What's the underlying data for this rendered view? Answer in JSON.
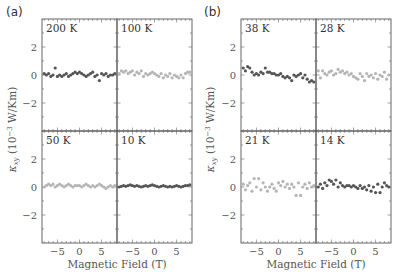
{
  "figure": {
    "panels": [
      {
        "letter": "(a)",
        "xlabel": "Magnetic Field (T)",
        "ylabel": "κ_xy (10^-3 W/Km)"
      },
      {
        "letter": "(b)",
        "xlabel": "Magnetic Field (T)",
        "ylabel": "κ_xy (10^-3 W/Km)"
      }
    ],
    "x_tick_labels": [
      "−5",
      "0",
      "5"
    ],
    "y_tick_labels": [
      "2",
      "0",
      "−2"
    ],
    "colors": {
      "dark": "#555555",
      "light": "#b5b5b5",
      "frame": "#555555"
    }
  },
  "chart_data": [
    {
      "type": "scatter",
      "title": "(a)",
      "xlabel": "Magnetic Field (T)",
      "ylabel": "κxy (10⁻³ W/Km)",
      "xlim": [
        -8.5,
        8.5
      ],
      "ylim": [
        -4,
        4
      ],
      "xticks": [
        -5,
        0,
        5
      ],
      "yticks": [
        -2,
        0,
        2
      ],
      "grid": false,
      "layout": "2x2 subplots sharing axes",
      "series": [
        {
          "name": "200 K",
          "subplot": "top-left",
          "color": "#555555",
          "x": [
            -8,
            -7.5,
            -7,
            -6.5,
            -6,
            -5.5,
            -5,
            -4.5,
            -4,
            -3.5,
            -3,
            -2.5,
            -2,
            -1.5,
            -1,
            -0.5,
            0,
            0.5,
            1,
            1.5,
            2,
            2.5,
            3,
            3.5,
            4,
            4.5,
            5,
            5.5,
            6,
            6.5,
            7,
            7.5,
            8
          ],
          "y": [
            0.1,
            0.0,
            0.1,
            -0.1,
            0.0,
            0.5,
            -0.1,
            0.0,
            -0.1,
            0.0,
            0.1,
            -0.1,
            0.0,
            0.1,
            0.2,
            0.1,
            0.2,
            0.1,
            0.0,
            -0.1,
            0.0,
            0.1,
            0.2,
            -0.1,
            0.0,
            -0.4,
            0.1,
            0.0,
            0.1,
            -0.1,
            0.0,
            0.0,
            0.1
          ]
        },
        {
          "name": "100 K",
          "subplot": "top-right",
          "color": "#b5b5b5",
          "x": [
            -8,
            -7.5,
            -7,
            -6.5,
            -6,
            -5.5,
            -5,
            -4.5,
            -4,
            -3.5,
            -3,
            -2.5,
            -2,
            -1.5,
            -1,
            -0.5,
            0,
            0.5,
            1,
            1.5,
            2,
            2.5,
            3,
            3.5,
            4,
            4.5,
            5,
            5.5,
            6,
            6.5,
            7,
            7.5,
            8
          ],
          "y": [
            0.1,
            0.3,
            0.2,
            0.3,
            0.1,
            0.2,
            0.3,
            0.0,
            0.2,
            0.1,
            0.3,
            -0.1,
            0.1,
            0.0,
            0.1,
            0.2,
            0.1,
            0.0,
            -0.1,
            0.1,
            -0.2,
            0.0,
            -0.1,
            0.1,
            -0.2,
            0.0,
            -0.1,
            -0.2,
            0.0,
            -0.2,
            0.1,
            0.2,
            0.2
          ]
        },
        {
          "name": "50 K",
          "subplot": "bottom-left",
          "color": "#b5b5b5",
          "x": [
            -8,
            -7.5,
            -7,
            -6.5,
            -6,
            -5.5,
            -5,
            -4.5,
            -4,
            -3.5,
            -3,
            -2.5,
            -2,
            -1.5,
            -1,
            -0.5,
            0,
            0.5,
            1,
            1.5,
            2,
            2.5,
            3,
            3.5,
            4,
            4.5,
            5,
            5.5,
            6,
            6.5,
            7,
            7.5,
            8
          ],
          "y": [
            0.0,
            0.1,
            0.2,
            0.1,
            0.2,
            0.0,
            0.1,
            0.2,
            0.1,
            0.0,
            0.1,
            0.2,
            0.1,
            0.0,
            0.1,
            0.1,
            0.1,
            0.0,
            0.1,
            0.2,
            0.1,
            0.0,
            0.1,
            0.0,
            0.1,
            0.2,
            0.1,
            0.0,
            -0.1,
            0.0,
            0.1,
            0.0,
            0.1
          ]
        },
        {
          "name": "10 K",
          "subplot": "bottom-right",
          "color": "#555555",
          "x": [
            -8,
            -7.5,
            -7,
            -6.5,
            -6,
            -5.5,
            -5,
            -4.5,
            -4,
            -3.5,
            -3,
            -2.5,
            -2,
            -1.5,
            -1,
            -0.5,
            0,
            0.5,
            1,
            1.5,
            2,
            2.5,
            3,
            3.5,
            4,
            4.5,
            5,
            5.5,
            6,
            6.5,
            7,
            7.5,
            8
          ],
          "y": [
            0.0,
            0.05,
            0.1,
            0.05,
            0.1,
            0.15,
            0.1,
            0.05,
            0.1,
            0.05,
            0.0,
            0.05,
            0.1,
            0.05,
            0.1,
            0.15,
            0.1,
            0.05,
            0.0,
            0.05,
            0.1,
            0.05,
            0.0,
            0.05,
            0.0,
            0.05,
            0.1,
            0.05,
            0.0,
            0.05,
            0.1,
            0.1,
            0.15
          ]
        }
      ]
    },
    {
      "type": "scatter",
      "title": "(b)",
      "xlabel": "Magnetic Field (T)",
      "ylabel": "κxy (10⁻³ W/Km)",
      "xlim": [
        -8.5,
        8.5
      ],
      "ylim": [
        -4,
        4
      ],
      "xticks": [
        -5,
        0,
        5
      ],
      "yticks": [
        -2,
        0,
        2
      ],
      "grid": false,
      "layout": "2x2 subplots sharing axes",
      "series": [
        {
          "name": "38 K",
          "subplot": "top-left",
          "color": "#555555",
          "x": [
            -8,
            -7.5,
            -7,
            -6.5,
            -6,
            -5.5,
            -5,
            -4.5,
            -4,
            -3.5,
            -3,
            -2.5,
            -2,
            -1.5,
            -1,
            -0.5,
            0,
            0.5,
            1,
            1.5,
            2,
            2.5,
            3,
            3.5,
            4,
            4.5,
            5,
            5.5,
            6,
            6.5,
            7,
            7.5,
            8
          ],
          "y": [
            0.5,
            0.3,
            0.6,
            0.5,
            0.2,
            0.0,
            0.1,
            0.0,
            0.2,
            0.1,
            0.5,
            0.2,
            0.2,
            0.1,
            0.1,
            0.0,
            0.0,
            0.1,
            -0.1,
            -0.2,
            -0.1,
            -0.2,
            -0.4,
            0.0,
            -0.1,
            0.0,
            0.1,
            -0.2,
            0.0,
            -0.3,
            -0.5,
            -0.4,
            -0.5
          ]
        },
        {
          "name": "28 K",
          "subplot": "top-right",
          "color": "#b5b5b5",
          "x": [
            -8,
            -7.5,
            -7,
            -6.5,
            -6,
            -5.5,
            -5,
            -4.5,
            -4,
            -3.5,
            -3,
            -2.5,
            -2,
            -1.5,
            -1,
            -0.5,
            0,
            0.5,
            1,
            1.5,
            2,
            2.5,
            3,
            3.5,
            4,
            4.5,
            5,
            5.5,
            6,
            6.5,
            7,
            7.5,
            8
          ],
          "y": [
            0.3,
            -0.2,
            0.3,
            0.1,
            0.0,
            0.2,
            0.3,
            0.0,
            0.1,
            0.4,
            0.2,
            0.3,
            0.1,
            0.2,
            0.0,
            0.1,
            -0.1,
            -0.2,
            -0.3,
            0.1,
            -0.1,
            -0.4,
            0.1,
            -0.1,
            0.0,
            -0.2,
            0.1,
            -0.3,
            0.0,
            -0.1,
            0.2,
            -0.3,
            0.0
          ]
        },
        {
          "name": "21 K",
          "subplot": "bottom-left",
          "color": "#b5b5b5",
          "x": [
            -8,
            -7.5,
            -7,
            -6.5,
            -6,
            -5.5,
            -5,
            -4.5,
            -4,
            -3.5,
            -3,
            -2.5,
            -2,
            -1.5,
            -1,
            -0.5,
            0,
            0.5,
            1,
            1.5,
            2,
            2.5,
            3,
            3.5,
            4,
            4.5,
            5,
            5.5,
            6,
            6.5,
            7,
            7.5,
            8
          ],
          "y": [
            0.2,
            -0.2,
            0.1,
            0.3,
            -0.3,
            0.6,
            0.0,
            0.6,
            -0.2,
            0.3,
            0.0,
            -0.3,
            0.0,
            0.2,
            -0.1,
            -0.3,
            0.3,
            0.1,
            0.4,
            0.0,
            0.2,
            -0.1,
            0.2,
            0.0,
            -0.6,
            0.3,
            -0.6,
            0.0,
            0.2,
            -0.1,
            0.3,
            0.0,
            0.1
          ]
        },
        {
          "name": "14 K",
          "subplot": "bottom-right",
          "color": "#555555",
          "x": [
            -8,
            -7.5,
            -7,
            -6.5,
            -6,
            -5.5,
            -5,
            -4.5,
            -4,
            -3.5,
            -3,
            -2.5,
            -2,
            -1.5,
            -1,
            -0.5,
            0,
            0.5,
            1,
            1.5,
            2,
            2.5,
            3,
            3.5,
            4,
            4.5,
            5,
            5.5,
            6,
            6.5,
            7,
            7.5,
            8
          ],
          "y": [
            0.0,
            0.2,
            -0.1,
            0.3,
            0.1,
            0.5,
            0.4,
            0.2,
            0.5,
            0.0,
            0.3,
            0.1,
            0.0,
            0.1,
            0.1,
            0.0,
            0.1,
            0.0,
            -0.1,
            0.1,
            -0.1,
            0.0,
            -0.2,
            0.1,
            -0.3,
            0.0,
            -0.4,
            0.2,
            -0.4,
            0.0,
            0.3,
            0.1,
            0.0
          ]
        }
      ]
    }
  ]
}
